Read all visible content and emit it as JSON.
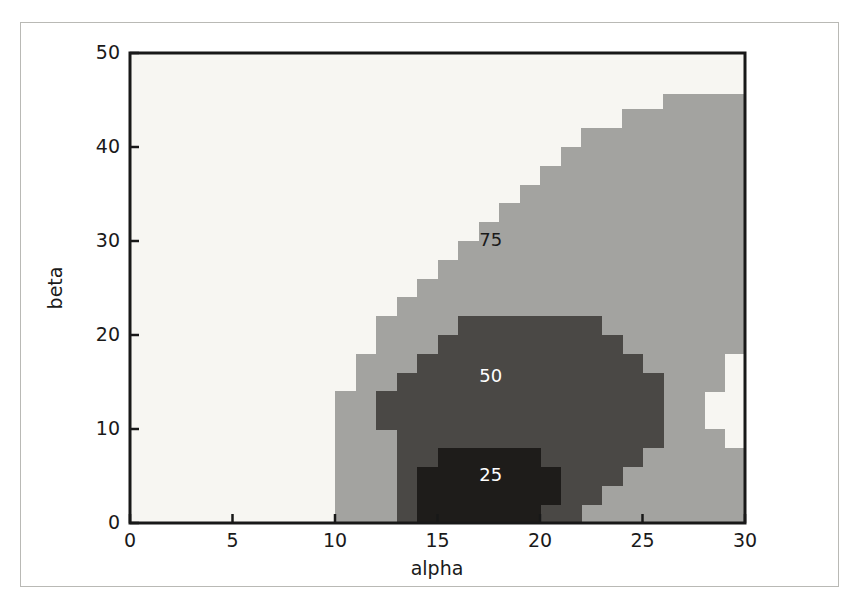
{
  "chart_data": {
    "type": "heatmap",
    "title": "",
    "subtitle": "",
    "xlabel": "alpha",
    "ylabel": "beta",
    "xlim": [
      0,
      30
    ],
    "ylim": [
      0,
      50
    ],
    "xticks": [
      0,
      5,
      10,
      15,
      20,
      25,
      30
    ],
    "xticklabels": [
      "0",
      "5",
      "10",
      "15",
      "20",
      "25",
      "30"
    ],
    "yticks": [
      0,
      10,
      20,
      30,
      40,
      50
    ],
    "yticklabels": [
      "0",
      "10",
      "20",
      "30",
      "40",
      "50"
    ],
    "grid": false,
    "legend": null,
    "style": "filled-contour (contourf) with inline level labels",
    "background_color": "#f7f6f2",
    "levels": [
      {
        "value": 25,
        "label": "25",
        "color": "#1e1c1a",
        "label_color": "#ffffff",
        "label_at": {
          "alpha": 17.6,
          "beta": 5.0
        }
      },
      {
        "value": 50,
        "label": "50",
        "color": "#4a4845",
        "label_color": "#ffffff",
        "label_at": {
          "alpha": 17.6,
          "beta": 15.5
        }
      },
      {
        "value": 75,
        "label": "75",
        "color": "#a3a3a0",
        "label_color": "#1a1a1a",
        "label_at": {
          "alpha": 17.6,
          "beta": 30.0
        }
      }
    ],
    "annotations": [
      "75",
      "50",
      "25"
    ],
    "bands": {
      "band_75_cells": [
        {
          "alpha_start": 10,
          "alpha_end": 30,
          "beta_start": 0,
          "beta_end": 2
        },
        {
          "alpha_start": 10,
          "alpha_end": 30,
          "beta_start": 2,
          "beta_end": 4
        },
        {
          "alpha_start": 10,
          "alpha_end": 30,
          "beta_start": 4,
          "beta_end": 6
        },
        {
          "alpha_start": 10,
          "alpha_end": 30,
          "beta_start": 6,
          "beta_end": 8
        },
        {
          "alpha_start": 10,
          "alpha_end": 29,
          "beta_start": 8,
          "beta_end": 10
        },
        {
          "alpha_start": 10,
          "alpha_end": 28,
          "beta_start": 10,
          "beta_end": 12
        },
        {
          "alpha_start": 10,
          "alpha_end": 28,
          "beta_start": 12,
          "beta_end": 14
        },
        {
          "alpha_start": 11,
          "alpha_end": 29,
          "beta_start": 14,
          "beta_end": 16
        },
        {
          "alpha_start": 11,
          "alpha_end": 29,
          "beta_start": 16,
          "beta_end": 18
        },
        {
          "alpha_start": 12,
          "alpha_end": 30,
          "beta_start": 18,
          "beta_end": 20
        },
        {
          "alpha_start": 12,
          "alpha_end": 30,
          "beta_start": 20,
          "beta_end": 22
        },
        {
          "alpha_start": 13,
          "alpha_end": 30,
          "beta_start": 22,
          "beta_end": 24
        },
        {
          "alpha_start": 14,
          "alpha_end": 30,
          "beta_start": 24,
          "beta_end": 26
        },
        {
          "alpha_start": 15,
          "alpha_end": 30,
          "beta_start": 26,
          "beta_end": 28
        },
        {
          "alpha_start": 16,
          "alpha_end": 30,
          "beta_start": 28,
          "beta_end": 30
        },
        {
          "alpha_start": 17,
          "alpha_end": 30,
          "beta_start": 30,
          "beta_end": 32
        },
        {
          "alpha_start": 18,
          "alpha_end": 30,
          "beta_start": 32,
          "beta_end": 34
        },
        {
          "alpha_start": 19,
          "alpha_end": 30,
          "beta_start": 34,
          "beta_end": 36
        },
        {
          "alpha_start": 20,
          "alpha_end": 30,
          "beta_start": 36,
          "beta_end": 38
        },
        {
          "alpha_start": 21,
          "alpha_end": 30,
          "beta_start": 38,
          "beta_end": 40
        },
        {
          "alpha_start": 22,
          "alpha_end": 30,
          "beta_start": 40,
          "beta_end": 42
        },
        {
          "alpha_start": 24,
          "alpha_end": 30,
          "beta_start": 42,
          "beta_end": 44
        },
        {
          "alpha_start": 26,
          "alpha_end": 30,
          "beta_start": 44,
          "beta_end": 45.6
        }
      ],
      "band_50_cells": [
        {
          "alpha_start": 13,
          "alpha_end": 22,
          "beta_start": 0,
          "beta_end": 2
        },
        {
          "alpha_start": 13,
          "alpha_end": 23,
          "beta_start": 2,
          "beta_end": 4
        },
        {
          "alpha_start": 13,
          "alpha_end": 24,
          "beta_start": 4,
          "beta_end": 6
        },
        {
          "alpha_start": 13,
          "alpha_end": 25,
          "beta_start": 6,
          "beta_end": 8
        },
        {
          "alpha_start": 13,
          "alpha_end": 26,
          "beta_start": 8,
          "beta_end": 10
        },
        {
          "alpha_start": 12,
          "alpha_end": 26,
          "beta_start": 10,
          "beta_end": 12
        },
        {
          "alpha_start": 12,
          "alpha_end": 26,
          "beta_start": 12,
          "beta_end": 14
        },
        {
          "alpha_start": 13,
          "alpha_end": 26,
          "beta_start": 14,
          "beta_end": 16
        },
        {
          "alpha_start": 14,
          "alpha_end": 25,
          "beta_start": 16,
          "beta_end": 18
        },
        {
          "alpha_start": 15,
          "alpha_end": 24,
          "beta_start": 18,
          "beta_end": 20
        },
        {
          "alpha_start": 16,
          "alpha_end": 23,
          "beta_start": 20,
          "beta_end": 22
        }
      ],
      "band_25_cells": [
        {
          "alpha_start": 14,
          "alpha_end": 20,
          "beta_start": 0,
          "beta_end": 2
        },
        {
          "alpha_start": 14,
          "alpha_end": 21,
          "beta_start": 2,
          "beta_end": 4
        },
        {
          "alpha_start": 14,
          "alpha_end": 21,
          "beta_start": 4,
          "beta_end": 6
        },
        {
          "alpha_start": 15,
          "alpha_end": 20,
          "beta_start": 6,
          "beta_end": 8
        }
      ]
    }
  },
  "axes": {
    "xlabel": "alpha",
    "ylabel": "beta"
  }
}
